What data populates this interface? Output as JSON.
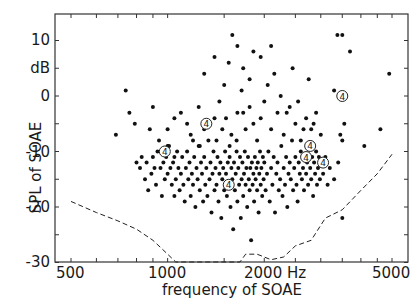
{
  "chart_data": {
    "type": "scatter",
    "title": "",
    "xlabel": "frequency of SOAE",
    "ylabel": "SPL of SOAE",
    "x_scale": "log",
    "xlim": [
      440,
      5300
    ],
    "ylim": [
      -30,
      13
    ],
    "x_ticks": [
      {
        "value": 500,
        "label": "500"
      },
      {
        "value": 1000,
        "label": "1000"
      },
      {
        "value": 2000,
        "label": "2000 Hz"
      },
      {
        "value": 5000,
        "label": "5000"
      }
    ],
    "x_minor_ticks": [
      600,
      700,
      800,
      900,
      1500,
      2500,
      3000,
      3500,
      4000,
      4500
    ],
    "y_ticks": [
      {
        "value": 10,
        "label": "10"
      },
      {
        "value": 5,
        "label": "dB"
      },
      {
        "value": 0,
        "label": "0"
      },
      {
        "value": -5,
        "label": ""
      },
      {
        "value": -10,
        "label": "-10"
      },
      {
        "value": -15,
        "label": ""
      },
      {
        "value": -20,
        "label": "-20"
      },
      {
        "value": -25,
        "label": ""
      },
      {
        "value": -30,
        "label": "-30"
      }
    ],
    "grid": false,
    "legend": null,
    "series": [
      {
        "name": "SOAE",
        "marker": "dot",
        "points": [
          [
            690,
            -7
          ],
          [
            740,
            1
          ],
          [
            760,
            -3
          ],
          [
            790,
            -5
          ],
          [
            800,
            -12
          ],
          [
            820,
            -13
          ],
          [
            830,
            -11
          ],
          [
            850,
            -15
          ],
          [
            860,
            -12
          ],
          [
            870,
            -17
          ],
          [
            880,
            -6
          ],
          [
            890,
            -14
          ],
          [
            900,
            -11
          ],
          [
            910,
            -13
          ],
          [
            920,
            -16
          ],
          [
            930,
            -10
          ],
          [
            940,
            -8
          ],
          [
            950,
            -13
          ],
          [
            960,
            -18
          ],
          [
            970,
            -12
          ],
          [
            980,
            -15
          ],
          [
            990,
            -11
          ],
          [
            1000,
            -14
          ],
          [
            1010,
            -9
          ],
          [
            1020,
            -13
          ],
          [
            1030,
            -16
          ],
          [
            1040,
            -12
          ],
          [
            1050,
            -18
          ],
          [
            1060,
            -15
          ],
          [
            1070,
            -10
          ],
          [
            1080,
            -13
          ],
          [
            1090,
            -17
          ],
          [
            1100,
            -14
          ],
          [
            1110,
            -11
          ],
          [
            1120,
            -16
          ],
          [
            1130,
            -19
          ],
          [
            1140,
            -13
          ],
          [
            1150,
            -10
          ],
          [
            1160,
            -15
          ],
          [
            1170,
            -12
          ],
          [
            1180,
            -18
          ],
          [
            1190,
            -14
          ],
          [
            1200,
            -16
          ],
          [
            1210,
            -11
          ],
          [
            1220,
            -20
          ],
          [
            1230,
            -13
          ],
          [
            1240,
            -15
          ],
          [
            1250,
            -9
          ],
          [
            1260,
            -17
          ],
          [
            1270,
            -12
          ],
          [
            1280,
            -14
          ],
          [
            1290,
            -19
          ],
          [
            1300,
            -11
          ],
          [
            1310,
            -16
          ],
          [
            1320,
            -13
          ],
          [
            1330,
            -18
          ],
          [
            1340,
            -8
          ],
          [
            1350,
            -15
          ],
          [
            1360,
            -12
          ],
          [
            1370,
            -21
          ],
          [
            1380,
            -14
          ],
          [
            1390,
            -10
          ],
          [
            1400,
            -17
          ],
          [
            1410,
            -13
          ],
          [
            1420,
            -16
          ],
          [
            1430,
            -11
          ],
          [
            1440,
            -19
          ],
          [
            1450,
            -14
          ],
          [
            1460,
            -12
          ],
          [
            1470,
            -22
          ],
          [
            1480,
            -15
          ],
          [
            1490,
            -13
          ],
          [
            1500,
            -17
          ],
          [
            1510,
            -10
          ],
          [
            1520,
            -14
          ],
          [
            1530,
            -18
          ],
          [
            1540,
            -12
          ],
          [
            1550,
            -16
          ],
          [
            1560,
            -11
          ],
          [
            1570,
            -20
          ],
          [
            1580,
            -13
          ],
          [
            1590,
            -15
          ],
          [
            1600,
            -24
          ],
          [
            1610,
            -12
          ],
          [
            1620,
            -17
          ],
          [
            1630,
            -14
          ],
          [
            1640,
            -10
          ],
          [
            1650,
            -19
          ],
          [
            1660,
            -13
          ],
          [
            1670,
            -16
          ],
          [
            1680,
            -11
          ],
          [
            1690,
            -22
          ],
          [
            1700,
            -15
          ],
          [
            1710,
            -12
          ],
          [
            1720,
            -18
          ],
          [
            1730,
            -14
          ],
          [
            1740,
            -10
          ],
          [
            1750,
            -16
          ],
          [
            1760,
            -13
          ],
          [
            1770,
            -20
          ],
          [
            1780,
            -11
          ],
          [
            1790,
            -15
          ],
          [
            1800,
            -17
          ],
          [
            1810,
            -13
          ],
          [
            1820,
            -26
          ],
          [
            1830,
            -12
          ],
          [
            1840,
            -16
          ],
          [
            1850,
            -14
          ],
          [
            1860,
            -19
          ],
          [
            1870,
            -11
          ],
          [
            1880,
            -15
          ],
          [
            1890,
            -13
          ],
          [
            1900,
            -17
          ],
          [
            1910,
            -12
          ],
          [
            1920,
            -21
          ],
          [
            1930,
            -14
          ],
          [
            1940,
            -10
          ],
          [
            1950,
            -16
          ],
          [
            1960,
            -13
          ],
          [
            1970,
            -18
          ],
          [
            1980,
            -11
          ],
          [
            1990,
            -15
          ],
          [
            2000,
            -12
          ],
          [
            2020,
            -17
          ],
          [
            2040,
            -14
          ],
          [
            2060,
            -10
          ],
          [
            2080,
            -19
          ],
          [
            2100,
            -13
          ],
          [
            2120,
            -16
          ],
          [
            2140,
            -11
          ],
          [
            2160,
            -21
          ],
          [
            2180,
            -14
          ],
          [
            2200,
            -12
          ],
          [
            2220,
            -17
          ],
          [
            2240,
            -15
          ],
          [
            2260,
            -9
          ],
          [
            2280,
            -18
          ],
          [
            2300,
            -13
          ],
          [
            2320,
            -16
          ],
          [
            2340,
            -11
          ],
          [
            2360,
            -20
          ],
          [
            2380,
            -14
          ],
          [
            2400,
            -12
          ],
          [
            2420,
            -15
          ],
          [
            2440,
            -8
          ],
          [
            2460,
            -17
          ],
          [
            2480,
            -13
          ],
          [
            2500,
            -11
          ],
          [
            2520,
            -16
          ],
          [
            2540,
            -19
          ],
          [
            2560,
            -12
          ],
          [
            2580,
            -14
          ],
          [
            2600,
            -10
          ],
          [
            2620,
            -15
          ],
          [
            2640,
            -13
          ],
          [
            2660,
            -17
          ],
          [
            2680,
            -11
          ],
          [
            2700,
            -14
          ],
          [
            2720,
            -12
          ],
          [
            2740,
            -16
          ],
          [
            2760,
            -9
          ],
          [
            2780,
            -13
          ],
          [
            2800,
            -15
          ],
          [
            2820,
            -11
          ],
          [
            2840,
            -18
          ],
          [
            2860,
            -12
          ],
          [
            2880,
            -14
          ],
          [
            2900,
            -10
          ],
          [
            2920,
            -16
          ],
          [
            2940,
            -13
          ],
          [
            2960,
            -11
          ],
          [
            2980,
            -15
          ],
          [
            3000,
            -12
          ],
          [
            3050,
            -14
          ],
          [
            3100,
            -11
          ],
          [
            3150,
            -16
          ],
          [
            3200,
            -13
          ],
          [
            3300,
            -15
          ],
          [
            3400,
            -12
          ],
          [
            3500,
            -22
          ],
          [
            1100,
            -3
          ],
          [
            1150,
            -5
          ],
          [
            1250,
            -2
          ],
          [
            1300,
            -6
          ],
          [
            1400,
            -4
          ],
          [
            1450,
            -1
          ],
          [
            1520,
            -4
          ],
          [
            1580,
            -7
          ],
          [
            1650,
            -3
          ],
          [
            1700,
            1
          ],
          [
            1750,
            -6
          ],
          [
            1800,
            -2
          ],
          [
            1850,
            -5
          ],
          [
            1900,
            -8
          ],
          [
            1950,
            -4
          ],
          [
            2000,
            -1
          ],
          [
            2100,
            -6
          ],
          [
            2200,
            -3
          ],
          [
            2300,
            -7
          ],
          [
            2400,
            -2
          ],
          [
            2500,
            -5
          ],
          [
            2600,
            -8
          ],
          [
            2700,
            -4
          ],
          [
            2800,
            -6
          ],
          [
            2900,
            -3
          ],
          [
            3000,
            -7
          ],
          [
            900,
            -2
          ],
          [
            1000,
            -6
          ],
          [
            1050,
            -4
          ],
          [
            1200,
            -8
          ],
          [
            1590,
            11
          ],
          [
            2050,
            2
          ],
          [
            2150,
            4
          ],
          [
            2250,
            0
          ],
          [
            2350,
            -3
          ],
          [
            2450,
            5
          ],
          [
            2550,
            -1
          ],
          [
            2650,
            -6
          ],
          [
            2750,
            3
          ],
          [
            2850,
            -5
          ],
          [
            3380,
            11
          ],
          [
            3500,
            11
          ],
          [
            3700,
            8
          ],
          [
            3300,
            1
          ],
          [
            3450,
            -7
          ],
          [
            3500,
            -8
          ],
          [
            3550,
            -5
          ],
          [
            4900,
            4
          ],
          [
            4600,
            -6
          ],
          [
            4100,
            -9
          ],
          [
            1720,
            5
          ],
          [
            1800,
            3
          ],
          [
            1850,
            8
          ],
          [
            1950,
            7
          ],
          [
            2100,
            9
          ],
          [
            1500,
            2
          ],
          [
            1550,
            6
          ],
          [
            1650,
            9
          ],
          [
            1400,
            7
          ],
          [
            1300,
            4
          ],
          [
            1000,
            -9
          ],
          [
            1050,
            -11
          ],
          [
            1180,
            -7
          ],
          [
            1260,
            -9
          ],
          [
            1340,
            -5
          ],
          [
            1420,
            -8
          ],
          [
            1480,
            -6
          ],
          [
            1560,
            -9
          ],
          [
            1640,
            -8
          ],
          [
            1720,
            -3
          ]
        ]
      }
    ],
    "annotations": [
      {
        "type": "circled-4",
        "x": 980,
        "y": -10
      },
      {
        "type": "circled-4",
        "x": 1320,
        "y": -5
      },
      {
        "type": "circled-4",
        "x": 1550,
        "y": -16
      },
      {
        "type": "circled-4",
        "x": 2780,
        "y": -9
      },
      {
        "type": "circled-4",
        "x": 2700,
        "y": -11
      },
      {
        "type": "circled-4",
        "x": 3050,
        "y": -12
      },
      {
        "type": "circled-4",
        "x": 3500,
        "y": 0
      }
    ],
    "threshold_curve": {
      "name": "hearing threshold",
      "style": "dashed",
      "points": [
        [
          500,
          -19
        ],
        [
          600,
          -21
        ],
        [
          700,
          -22.5
        ],
        [
          800,
          -24
        ],
        [
          900,
          -26
        ],
        [
          1000,
          -28.5
        ],
        [
          1060,
          -30.5
        ],
        [
          1680,
          -30.5
        ],
        [
          1750,
          -28.5
        ],
        [
          1900,
          -28.5
        ],
        [
          2100,
          -29.5
        ],
        [
          2300,
          -29
        ],
        [
          2500,
          -27
        ],
        [
          2800,
          -26
        ],
        [
          3100,
          -22
        ],
        [
          3500,
          -20.5
        ],
        [
          4000,
          -17
        ],
        [
          4500,
          -14
        ],
        [
          5000,
          -10.5
        ]
      ]
    }
  }
}
